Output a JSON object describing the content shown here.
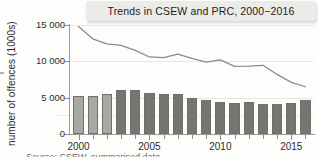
{
  "title": "Trends in CSEW and PRC, 2000−2016",
  "source_note": "Source: CSEW, summarised data",
  "colors": {
    "bar_light": "#a8a8a4",
    "bar_dark": "#757571",
    "bar_border": "#6f6f6b",
    "line": "#8b8b87",
    "grid": "#e6e6e4",
    "axis": "#9a9a96",
    "title_box": "#ebebe9",
    "background": "#fdfdfc"
  },
  "axes": {
    "y_title": "number of offences (1000s)",
    "y_ticks": [
      "0",
      "5 000",
      "10 000",
      "15 000"
    ],
    "y_tick_values": [
      0,
      5000,
      10000,
      15000
    ],
    "ylim": [
      0,
      15000
    ],
    "x_major_labels": [
      "2000",
      "2005",
      "2010",
      "2015"
    ],
    "x_major_values": [
      2000,
      2005,
      2010,
      2015
    ],
    "xlim": [
      1999.4,
      2016.6
    ],
    "grid": "horizontal"
  },
  "chart_data": {
    "type": "bar",
    "title": "Trends in CSEW and PRC, 2000−2016",
    "xlabel": "",
    "ylabel": "number of offences (1000s)",
    "ylim": [
      0,
      15000
    ],
    "yticks": [
      0,
      5000,
      10000,
      15000
    ],
    "ytick_labels": [
      "0",
      "5 000",
      "10 000",
      "15 000"
    ],
    "grid": true,
    "legend": "none",
    "categories": [
      2000,
      2001,
      2002,
      2003,
      2004,
      2005,
      2006,
      2007,
      2008,
      2009,
      2010,
      2011,
      2012,
      2013,
      2014,
      2015,
      2016
    ],
    "series": [
      {
        "name": "PRC",
        "type": "bar",
        "values": [
          5300,
          5200,
          5500,
          6000,
          6000,
          5600,
          5550,
          5450,
          5000,
          4700,
          4350,
          4200,
          4450,
          4150,
          4150,
          4250,
          4650
        ],
        "bar_shades": [
          "light",
          "light",
          "light",
          "dark",
          "dark",
          "dark",
          "dark",
          "dark",
          "dark",
          "dark",
          "dark",
          "dark",
          "dark",
          "dark",
          "dark",
          "dark",
          "dark"
        ]
      },
      {
        "name": "CSEW",
        "type": "line",
        "values": [
          14800,
          13100,
          12400,
          12200,
          11500,
          10600,
          10500,
          11000,
          10400,
          9900,
          10200,
          9300,
          9350,
          9450,
          8200,
          7100,
          6500
        ]
      }
    ]
  }
}
